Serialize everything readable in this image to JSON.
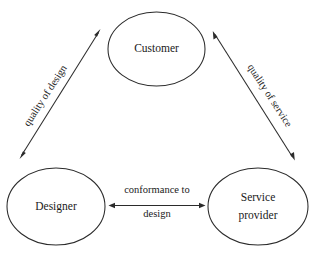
{
  "diagram": {
    "background_color": "#ffffff",
    "stroke_color": "#2b2b2b",
    "text_color": "#1a1a1a",
    "nodes": [
      {
        "id": "customer",
        "label": "Customer",
        "shape": "ellipse",
        "cx": 156.5,
        "cy": 49,
        "rx": 48.5,
        "ry": 37
      },
      {
        "id": "designer",
        "label": "Designer",
        "shape": "ellipse",
        "cx": 56,
        "cy": 206.5,
        "rx": 49,
        "ry": 38.5
      },
      {
        "id": "service-provider",
        "label_line1": "Service",
        "label_line2": "provider",
        "shape": "ellipse",
        "cx": 258,
        "cy": 206.5,
        "rx": 50,
        "ry": 38.5
      }
    ],
    "edges": [
      {
        "id": "quality-of-design",
        "label": "quality of design",
        "from": "designer",
        "to": "customer",
        "arrow": "double",
        "rotation_deg": -57,
        "label_x": 46,
        "label_y": 96
      },
      {
        "id": "quality-of-service",
        "label": "quality of service",
        "from": "customer",
        "to": "service-provider",
        "arrow": "double",
        "rotation_deg": 57,
        "label_x": 269,
        "label_y": 96
      },
      {
        "id": "conformance-to-design",
        "label_line1": "conformance to",
        "label_line2": "design",
        "from": "designer",
        "to": "service-provider",
        "arrow": "double",
        "rotation_deg": 0,
        "label_x": 157,
        "label_y": 194
      }
    ]
  }
}
